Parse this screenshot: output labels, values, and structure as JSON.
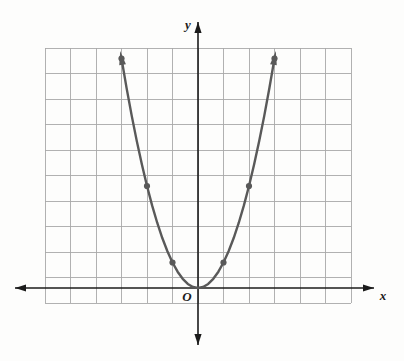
{
  "figure": {
    "kind": "coordinate-grid-graph",
    "background_color": "#fdfdfc",
    "grid": {
      "color": "#a9a9a9",
      "line_width": 0.9,
      "cell_size_px": 25.5,
      "columns": 12,
      "rows": 10,
      "left_px": 45,
      "top_px": 48,
      "right_px": 351,
      "bottom_px": 303,
      "origin_col_index": 6,
      "origin_row_index": 9
    },
    "axes": {
      "color": "#1b1b1b",
      "line_width": 1.6,
      "x_axis": {
        "label": "x",
        "y_px": 288,
        "start_px": 15,
        "end_px": 374,
        "arrow_left": true,
        "arrow_right": true
      },
      "y_axis": {
        "label": "y",
        "x_px": 198,
        "start_px": 345,
        "end_px": 22,
        "arrow_up": true,
        "arrow_down": true
      },
      "origin_label": "O"
    },
    "curve": {
      "color": "#595959",
      "line_width": 2.4,
      "arrow_start": true,
      "arrow_end": true,
      "point_marker_color": "#595959",
      "point_marker_radius_px": 3.1
    }
  },
  "chart_data": {
    "type": "line",
    "title": "",
    "subtitle": "",
    "xlabel": "x",
    "ylabel": "y",
    "equation": "y = x^2",
    "curve_shape": "parabola opening upward",
    "vertex": [
      0,
      0
    ],
    "axis_of_symmetry": "x = 0",
    "grid": true,
    "legend": false,
    "xlim": [
      -6,
      6
    ],
    "ylim": [
      -1,
      9
    ],
    "x_tick_step": 1,
    "y_tick_step": 1,
    "x_tick_labels": [],
    "y_tick_labels": [],
    "annotations": [
      "O"
    ],
    "marked_points": [
      [
        -3,
        9
      ],
      [
        -2,
        4
      ],
      [
        -1,
        1
      ],
      [
        0,
        0
      ],
      [
        1,
        1
      ],
      [
        2,
        4
      ],
      [
        3,
        9
      ]
    ],
    "plotted_points": [
      [
        -3.0,
        9.0
      ],
      [
        -2.8,
        7.84
      ],
      [
        -2.6,
        6.76
      ],
      [
        -2.4,
        5.76
      ],
      [
        -2.2,
        4.84
      ],
      [
        -2.0,
        4.0
      ],
      [
        -1.8,
        3.24
      ],
      [
        -1.6,
        2.56
      ],
      [
        -1.4,
        1.96
      ],
      [
        -1.2,
        1.44
      ],
      [
        -1.0,
        1.0
      ],
      [
        -0.8,
        0.64
      ],
      [
        -0.6,
        0.36
      ],
      [
        -0.4,
        0.16
      ],
      [
        -0.2,
        0.04
      ],
      [
        0.0,
        0.0
      ],
      [
        0.2,
        0.04
      ],
      [
        0.4,
        0.16
      ],
      [
        0.6,
        0.36
      ],
      [
        0.8,
        0.64
      ],
      [
        1.0,
        1.0
      ],
      [
        1.2,
        1.44
      ],
      [
        1.4,
        1.96
      ],
      [
        1.6,
        2.56
      ],
      [
        1.8,
        3.24
      ],
      [
        2.0,
        4.0
      ],
      [
        2.2,
        4.84
      ],
      [
        2.4,
        5.76
      ],
      [
        2.6,
        6.76
      ],
      [
        2.8,
        7.84
      ],
      [
        3.0,
        9.0
      ]
    ],
    "series": [
      {
        "name": "y = x^2",
        "x": [
          -3,
          -2,
          -1,
          0,
          1,
          2,
          3
        ],
        "values": [
          9,
          4,
          1,
          0,
          1,
          4,
          9
        ]
      }
    ]
  }
}
